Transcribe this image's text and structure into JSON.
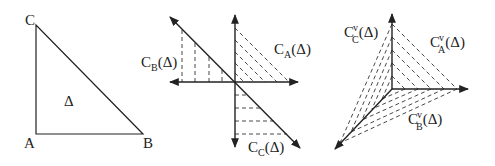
{
  "panels": {
    "triangle": {
      "vertices": [
        "C",
        "A",
        "B"
      ],
      "interior_label": "Δ"
    },
    "cones": {
      "labels": [
        {
          "main": "C",
          "sub": "B",
          "arg": "(Δ)"
        },
        {
          "main": "C",
          "sub": "A",
          "arg": "(Δ)"
        },
        {
          "main": "C",
          "sub": "C",
          "arg": "(Δ)"
        }
      ]
    },
    "dual_cones": {
      "labels": [
        {
          "main": "C",
          "sup": "v",
          "sub": "C",
          "arg": "(Δ)"
        },
        {
          "main": "C",
          "sup": "v",
          "sub": "A",
          "arg": "(Δ)"
        },
        {
          "main": "C",
          "sup": "v",
          "sub": "B",
          "arg": "(Δ)"
        }
      ]
    }
  }
}
